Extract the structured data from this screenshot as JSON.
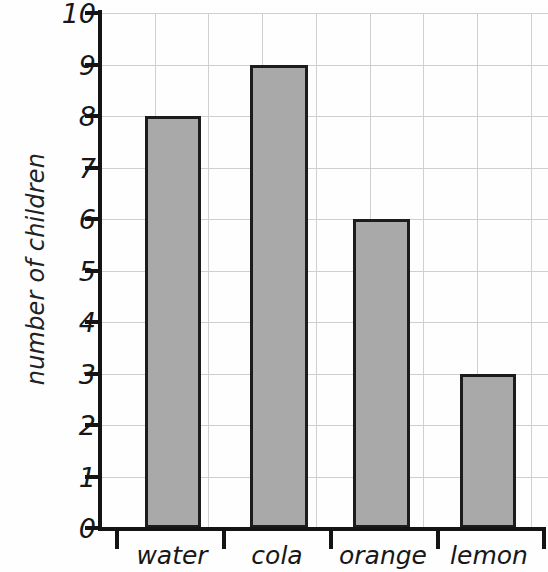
{
  "chart_data": {
    "type": "bar",
    "title": "",
    "xlabel": "",
    "ylabel": "number of children",
    "categories": [
      "water",
      "cola",
      "orange",
      "lemon"
    ],
    "values": [
      8,
      9,
      6,
      3
    ],
    "ylim": [
      0,
      10
    ],
    "y_ticks": [
      0,
      1,
      2,
      3,
      4,
      5,
      6,
      7,
      8,
      9,
      10
    ],
    "y_tick_labels": [
      "0",
      "1",
      "2",
      "3",
      "4",
      "5",
      "6",
      "7",
      "8",
      "9",
      "10"
    ],
    "grid": true,
    "legend": false,
    "bar_color": "#a9a9a9",
    "bar_edge_color": "#1c1c1c",
    "grid_color": "#cfcfcf",
    "axis_color": "#141414",
    "background_color": "#fefefe"
  }
}
